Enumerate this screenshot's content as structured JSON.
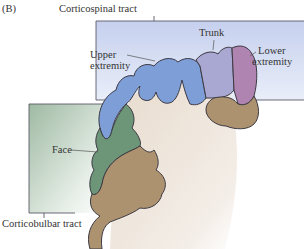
{
  "figure": {
    "panel_label": "(B)",
    "colors": {
      "spinal_box": "#c9d3ef",
      "bulbar_box": "#a9c2ad",
      "upper_extremity": "#7e9ed8",
      "trunk": "#a9a8d2",
      "lower_extremity": "#b084b0",
      "face": "#6c9677",
      "other_cortex": "#ad9270",
      "white_matter": "#ece2d6",
      "outline": "#3d3a44"
    },
    "tracts": {
      "corticospinal": "Corticospinal tract",
      "corticobulbar": "Corticobulbar tract"
    },
    "regions": {
      "upper_line1": "Upper",
      "upper_line2": "extremity",
      "trunk": "Trunk",
      "lower_line1": "Lower",
      "lower_line2": "extremity",
      "face": "Face"
    }
  }
}
